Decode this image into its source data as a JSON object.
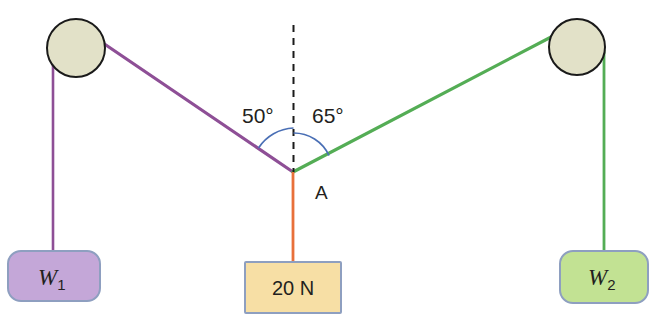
{
  "diagram": {
    "junction": {
      "label": "A"
    },
    "angles": {
      "left": "50°",
      "right": "65°"
    },
    "weights": {
      "left": {
        "symbol": "W",
        "subscript": "1"
      },
      "right": {
        "symbol": "W",
        "subscript": "2"
      },
      "center": "20 N"
    },
    "colors": {
      "left_string": "#8e4f96",
      "right_string": "#54ad55",
      "center_string": "#e8703a",
      "pulley_fill": "#e2e1c8",
      "pulley_stroke": "#1a1a1a",
      "left_box_fill": "#c4a7d8",
      "right_box_fill": "#c2e293",
      "center_box_fill": "#f7dfa5",
      "box_stroke": "#8e9fc0",
      "angle_arc": "#4a6fb5",
      "dashed_line": "#1a1a1a"
    },
    "geometry": {
      "left_pulley": {
        "cx": 76,
        "cy": 48,
        "r": 29
      },
      "right_pulley": {
        "cx": 577,
        "cy": 47,
        "r": 28
      },
      "junction_point": {
        "x": 293,
        "y": 172
      },
      "vertical_dashed_top": 25
    }
  }
}
